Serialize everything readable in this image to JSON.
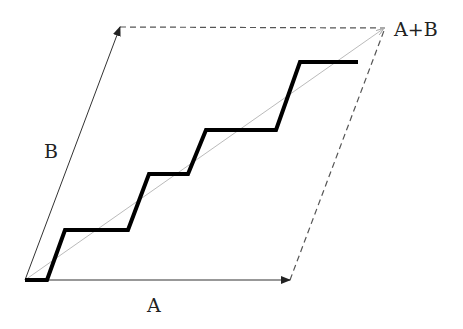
{
  "diagram": {
    "labels": {
      "a": "A",
      "b": "B",
      "sum": "A+B"
    },
    "points": {
      "origin": [
        25,
        280
      ],
      "a_end": [
        290,
        280
      ],
      "b_end": [
        120,
        27
      ],
      "sum_end": [
        385,
        28
      ]
    },
    "staircase": [
      [
        25,
        280
      ],
      [
        47,
        280
      ],
      [
        65,
        230
      ],
      [
        128,
        230
      ],
      [
        149,
        174
      ],
      [
        188,
        174
      ],
      [
        206,
        130
      ],
      [
        276,
        130
      ],
      [
        300,
        62
      ],
      [
        358,
        62
      ]
    ],
    "colors": {
      "vector": "#333333",
      "dashed": "#555555",
      "diagonal": "#bbbbbb",
      "staircase": "#000000"
    }
  }
}
